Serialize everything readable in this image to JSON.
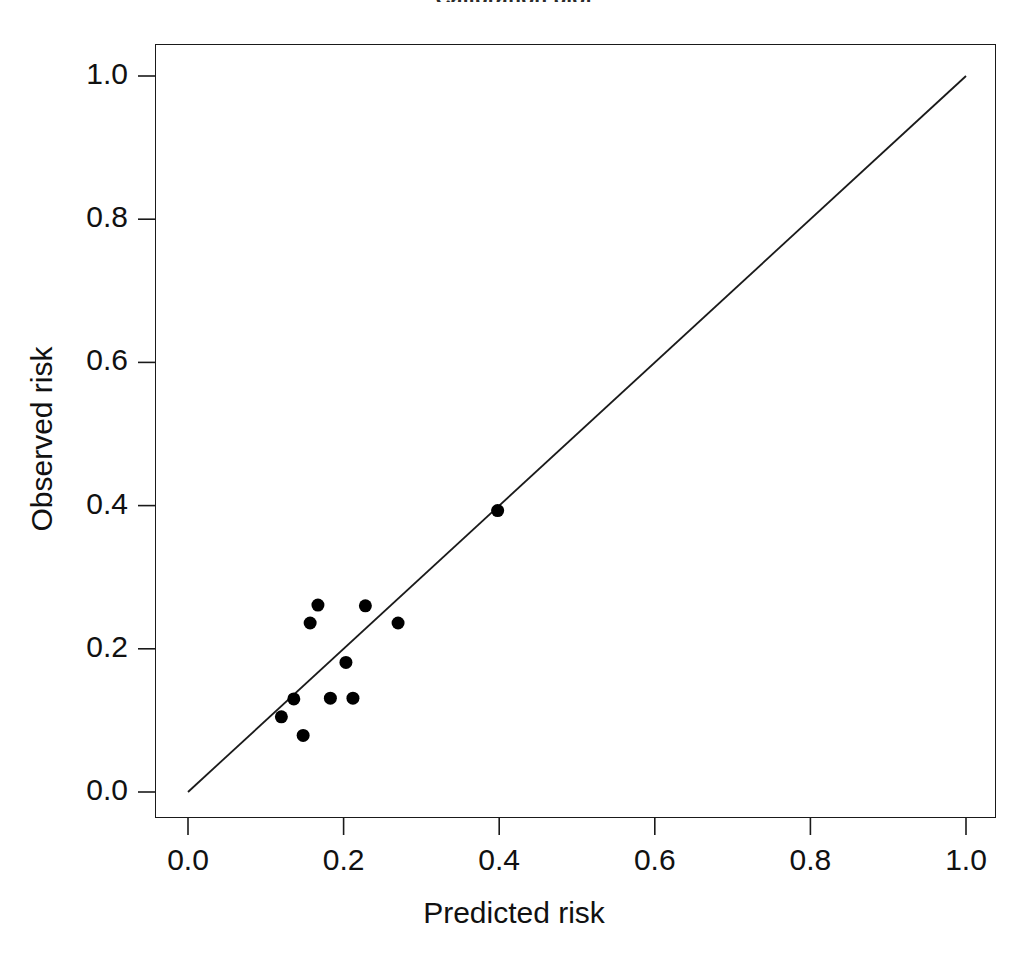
{
  "figure": {
    "title_clipped": "Calibration plot",
    "background_color": "#ffffff",
    "foreground_color": "#111111"
  },
  "axes": {
    "x_title": "Predicted risk",
    "y_title": "Observed risk",
    "x_ticks": [
      "0.0",
      "0.2",
      "0.4",
      "0.6",
      "0.8",
      "1.0"
    ],
    "y_ticks": [
      "0.0",
      "0.2",
      "0.4",
      "0.6",
      "0.8",
      "1.0"
    ]
  },
  "chart_data": {
    "type": "scatter",
    "title": "Calibration plot",
    "xlabel": "Predicted risk",
    "ylabel": "Observed risk",
    "xlim": [
      0.0,
      1.0
    ],
    "ylim": [
      0.0,
      1.0
    ],
    "xticks": [
      0.0,
      0.2,
      0.4,
      0.6,
      0.8,
      1.0
    ],
    "yticks": [
      0.0,
      0.2,
      0.4,
      0.6,
      0.8,
      1.0
    ],
    "grid": false,
    "legend": "none",
    "point_color": "#000000",
    "point_marker": "filled-circle",
    "point_size_px": 13,
    "series": [
      {
        "name": "Risk deciles",
        "marker": "filled-circle",
        "color": "#000000",
        "points": [
          {
            "x": 0.12,
            "y": 0.105
          },
          {
            "x": 0.136,
            "y": 0.13
          },
          {
            "x": 0.148,
            "y": 0.079
          },
          {
            "x": 0.157,
            "y": 0.236
          },
          {
            "x": 0.167,
            "y": 0.261
          },
          {
            "x": 0.183,
            "y": 0.131
          },
          {
            "x": 0.203,
            "y": 0.181
          },
          {
            "x": 0.212,
            "y": 0.131
          },
          {
            "x": 0.228,
            "y": 0.26
          },
          {
            "x": 0.27,
            "y": 0.236
          },
          {
            "x": 0.398,
            "y": 0.393
          }
        ]
      }
    ],
    "reference_line": {
      "name": "ideal-calibration-line",
      "from": [
        0.0,
        0.0
      ],
      "to": [
        1.0,
        1.0
      ],
      "color": "#1a1a1a",
      "style": "solid",
      "width_px": 1.8
    }
  }
}
